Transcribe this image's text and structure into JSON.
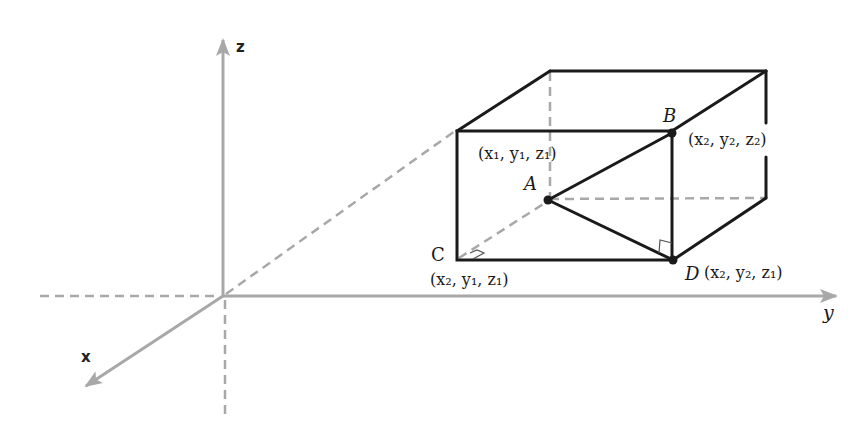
{
  "diagram": {
    "type": "3D coordinate box with right triangles",
    "axes": {
      "x": {
        "label": "x"
      },
      "y": {
        "label": "y"
      },
      "z": {
        "label": "z"
      }
    },
    "points": {
      "A": {
        "label": "A",
        "coords": "(x₁, y₁, z₁)"
      },
      "B": {
        "label": "B",
        "coords": "(x₂, y₂, z₂)"
      },
      "C": {
        "label": "C",
        "coords": "(x₂, y₁, z₁)"
      },
      "D": {
        "label": "D",
        "coords": "(x₂, y₂, z₁)"
      }
    },
    "colors": {
      "axes": "#a8a8a8",
      "edges": "#1a1a1a",
      "background": "#ffffff"
    }
  }
}
